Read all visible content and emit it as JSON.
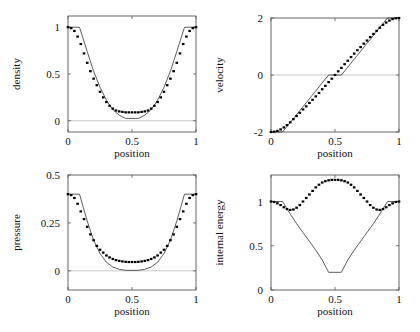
{
  "chart_data": [
    {
      "type": "line",
      "id": "density",
      "title": "",
      "xlabel": "position",
      "ylabel": "density",
      "xlim": [
        0,
        1
      ],
      "ylim": [
        -0.12,
        1.12
      ],
      "xticks": [
        0,
        0.5,
        1
      ],
      "xtick_labels": [
        "0",
        "0.5",
        "1"
      ],
      "yticks": [
        0,
        0.5,
        1
      ],
      "ytick_labels": [
        "0",
        "0.5",
        "1"
      ],
      "zero_line": true,
      "grid": false,
      "series": [
        {
          "name": "exact",
          "style": "solid-line",
          "x": [
            0,
            0.09,
            0.15,
            0.2,
            0.25,
            0.3,
            0.35,
            0.4,
            0.45,
            0.5,
            0.55,
            0.6,
            0.65,
            0.7,
            0.75,
            0.8,
            0.85,
            0.91,
            1
          ],
          "y": [
            1,
            1,
            0.74,
            0.53,
            0.36,
            0.22,
            0.12,
            0.06,
            0.025,
            0.025,
            0.025,
            0.06,
            0.12,
            0.22,
            0.36,
            0.53,
            0.74,
            1,
            1
          ]
        },
        {
          "name": "numerical",
          "style": "dots",
          "x": [
            0,
            0.025,
            0.05,
            0.075,
            0.1,
            0.125,
            0.15,
            0.175,
            0.2,
            0.225,
            0.25,
            0.275,
            0.3,
            0.325,
            0.35,
            0.375,
            0.4,
            0.425,
            0.45,
            0.475,
            0.5,
            0.525,
            0.55,
            0.575,
            0.6,
            0.625,
            0.65,
            0.675,
            0.7,
            0.725,
            0.75,
            0.775,
            0.8,
            0.825,
            0.85,
            0.875,
            0.9,
            0.925,
            0.95,
            0.975,
            1
          ],
          "y": [
            1,
            0.99,
            0.96,
            0.9,
            0.82,
            0.72,
            0.62,
            0.53,
            0.45,
            0.38,
            0.31,
            0.25,
            0.2,
            0.16,
            0.13,
            0.11,
            0.1,
            0.095,
            0.09,
            0.09,
            0.09,
            0.09,
            0.09,
            0.095,
            0.1,
            0.11,
            0.13,
            0.16,
            0.2,
            0.25,
            0.31,
            0.38,
            0.45,
            0.53,
            0.62,
            0.72,
            0.82,
            0.9,
            0.96,
            0.99,
            1
          ]
        }
      ]
    },
    {
      "type": "line",
      "id": "velocity",
      "title": "",
      "xlabel": "position",
      "ylabel": "velocity",
      "xlim": [
        0,
        1
      ],
      "ylim": [
        -2,
        2
      ],
      "xticks": [
        0,
        0.5,
        1
      ],
      "xtick_labels": [
        "0",
        "0.5",
        "1"
      ],
      "yticks": [
        -2,
        0,
        2
      ],
      "ytick_labels": [
        "-2",
        "0",
        "2"
      ],
      "zero_line": true,
      "grid": false,
      "series": [
        {
          "name": "exact",
          "style": "solid-line",
          "x": [
            0,
            0.09,
            0.45,
            0.55,
            0.91,
            1
          ],
          "y": [
            -2,
            -2,
            0,
            0,
            2,
            2
          ]
        },
        {
          "name": "numerical",
          "style": "dots",
          "x": [
            0,
            0.025,
            0.05,
            0.075,
            0.1,
            0.125,
            0.15,
            0.175,
            0.2,
            0.225,
            0.25,
            0.275,
            0.3,
            0.325,
            0.35,
            0.375,
            0.4,
            0.425,
            0.45,
            0.475,
            0.5,
            0.525,
            0.55,
            0.575,
            0.6,
            0.625,
            0.65,
            0.675,
            0.7,
            0.725,
            0.75,
            0.775,
            0.8,
            0.825,
            0.85,
            0.875,
            0.9,
            0.925,
            0.95,
            0.975,
            1
          ],
          "y": [
            -2,
            -1.99,
            -1.96,
            -1.91,
            -1.84,
            -1.76,
            -1.66,
            -1.55,
            -1.44,
            -1.33,
            -1.21,
            -1.1,
            -0.98,
            -0.87,
            -0.75,
            -0.63,
            -0.5,
            -0.38,
            -0.25,
            -0.13,
            0,
            0.13,
            0.25,
            0.38,
            0.5,
            0.63,
            0.75,
            0.87,
            0.98,
            1.1,
            1.21,
            1.33,
            1.44,
            1.55,
            1.66,
            1.76,
            1.84,
            1.91,
            1.96,
            1.99,
            2
          ]
        }
      ]
    },
    {
      "type": "line",
      "id": "pressure",
      "title": "",
      "xlabel": "position",
      "ylabel": "pressure",
      "xlim": [
        0,
        1
      ],
      "ylim": [
        -0.1,
        0.5
      ],
      "xticks": [
        0,
        0.5,
        1
      ],
      "xtick_labels": [
        "0",
        "0.5",
        "1"
      ],
      "yticks": [
        0,
        0.25,
        0.5
      ],
      "ytick_labels": [
        "0",
        "0.25",
        "0.5"
      ],
      "zero_line": true,
      "grid": false,
      "series": [
        {
          "name": "exact",
          "style": "solid-line",
          "x": [
            0,
            0.09,
            0.15,
            0.2,
            0.25,
            0.3,
            0.35,
            0.4,
            0.45,
            0.5,
            0.55,
            0.6,
            0.65,
            0.7,
            0.75,
            0.8,
            0.85,
            0.91,
            1
          ],
          "y": [
            0.4,
            0.4,
            0.26,
            0.16,
            0.09,
            0.045,
            0.02,
            0.008,
            0.003,
            0.002,
            0.003,
            0.008,
            0.02,
            0.045,
            0.09,
            0.16,
            0.26,
            0.4,
            0.4
          ]
        },
        {
          "name": "numerical",
          "style": "dots",
          "x": [
            0,
            0.025,
            0.05,
            0.075,
            0.1,
            0.125,
            0.15,
            0.175,
            0.2,
            0.225,
            0.25,
            0.275,
            0.3,
            0.325,
            0.35,
            0.375,
            0.4,
            0.425,
            0.45,
            0.475,
            0.5,
            0.525,
            0.55,
            0.575,
            0.6,
            0.625,
            0.65,
            0.675,
            0.7,
            0.725,
            0.75,
            0.775,
            0.8,
            0.825,
            0.85,
            0.875,
            0.9,
            0.925,
            0.95,
            0.975,
            1
          ],
          "y": [
            0.4,
            0.395,
            0.38,
            0.35,
            0.31,
            0.27,
            0.23,
            0.19,
            0.16,
            0.13,
            0.11,
            0.095,
            0.08,
            0.07,
            0.062,
            0.056,
            0.052,
            0.049,
            0.047,
            0.046,
            0.046,
            0.046,
            0.047,
            0.049,
            0.052,
            0.056,
            0.062,
            0.07,
            0.08,
            0.095,
            0.11,
            0.13,
            0.16,
            0.19,
            0.23,
            0.27,
            0.31,
            0.35,
            0.38,
            0.395,
            0.4
          ]
        }
      ]
    },
    {
      "type": "line",
      "id": "internal_energy",
      "title": "",
      "xlabel": "position",
      "ylabel": "internal energy",
      "xlim": [
        0,
        1
      ],
      "ylim": [
        0,
        1.3
      ],
      "xticks": [
        0,
        0.5,
        1
      ],
      "xtick_labels": [
        "0",
        "0.5",
        "1"
      ],
      "yticks": [
        0,
        0.5,
        1
      ],
      "ytick_labels": [
        "0",
        "0.5",
        "1"
      ],
      "zero_line": false,
      "grid": false,
      "series": [
        {
          "name": "exact",
          "style": "solid-line",
          "x": [
            0,
            0.09,
            0.15,
            0.2,
            0.25,
            0.3,
            0.35,
            0.4,
            0.45,
            0.55,
            0.6,
            0.65,
            0.7,
            0.75,
            0.8,
            0.85,
            0.91,
            1
          ],
          "y": [
            1,
            1,
            0.86,
            0.75,
            0.65,
            0.55,
            0.45,
            0.34,
            0.2,
            0.2,
            0.34,
            0.45,
            0.55,
            0.65,
            0.75,
            0.86,
            1,
            1
          ]
        },
        {
          "name": "numerical",
          "style": "dots",
          "x": [
            0,
            0.025,
            0.05,
            0.075,
            0.1,
            0.125,
            0.15,
            0.175,
            0.2,
            0.225,
            0.25,
            0.275,
            0.3,
            0.325,
            0.35,
            0.375,
            0.4,
            0.425,
            0.45,
            0.475,
            0.5,
            0.525,
            0.55,
            0.575,
            0.6,
            0.625,
            0.65,
            0.675,
            0.7,
            0.725,
            0.75,
            0.775,
            0.8,
            0.825,
            0.85,
            0.875,
            0.9,
            0.925,
            0.95,
            0.975,
            1
          ],
          "y": [
            1,
            0.995,
            0.98,
            0.96,
            0.935,
            0.915,
            0.905,
            0.91,
            0.93,
            0.96,
            1.0,
            1.04,
            1.08,
            1.12,
            1.16,
            1.19,
            1.215,
            1.23,
            1.24,
            1.245,
            1.245,
            1.245,
            1.24,
            1.23,
            1.215,
            1.19,
            1.16,
            1.12,
            1.08,
            1.04,
            1.0,
            0.96,
            0.93,
            0.91,
            0.905,
            0.915,
            0.935,
            0.96,
            0.98,
            0.995,
            1
          ]
        }
      ]
    }
  ],
  "panels_layout": [
    {
      "chart": 0,
      "frame": [
        68,
        16,
        128,
        116
      ]
    },
    {
      "chart": 1,
      "frame": [
        271,
        18,
        128,
        114
      ]
    },
    {
      "chart": 2,
      "frame": [
        68,
        175,
        128,
        115
      ]
    },
    {
      "chart": 3,
      "frame": [
        271,
        175,
        128,
        115
      ]
    }
  ]
}
